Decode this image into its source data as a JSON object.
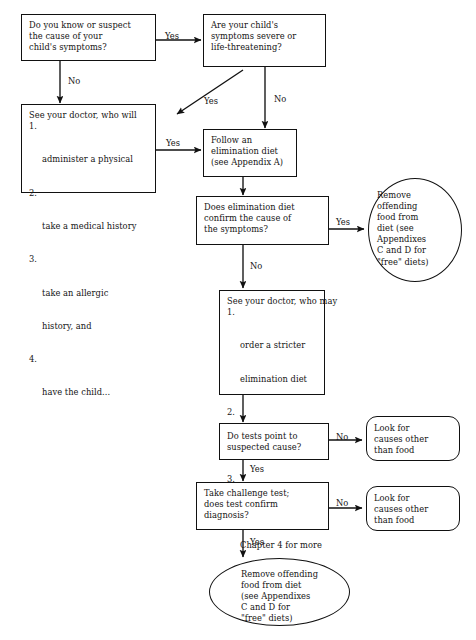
{
  "diagram": {
    "line_color": "#111111",
    "background": "#ffffff",
    "text_color": "#141414"
  },
  "nodes": {
    "q_know_cause": {
      "shape": "rectangle",
      "lines": [
        "Do you know or suspect",
        "the cause of your",
        "child's symptoms?"
      ]
    },
    "q_severe": {
      "shape": "rectangle",
      "lines": [
        "Are your child's",
        "symptoms severe or",
        "life-threatening?"
      ]
    },
    "doctor_will": {
      "shape": "rectangle",
      "heading": "See your doctor, who will",
      "items": [
        {
          "num": "1.",
          "lines": [
            "administer a physical"
          ]
        },
        {
          "num": "2.",
          "lines": [
            "take a medical history"
          ]
        },
        {
          "num": "3.",
          "lines": [
            "take an allergic",
            "history, and"
          ]
        },
        {
          "num": "4.",
          "lines": [
            "have the child..."
          ]
        }
      ]
    },
    "follow_diet": {
      "shape": "rectangle",
      "lines": [
        "Follow an",
        "elimination diet",
        "(see Appendix A)"
      ]
    },
    "q_diet_confirm": {
      "shape": "rectangle",
      "lines": [
        "Does elimination diet",
        "confirm the cause of",
        "the symptoms?"
      ]
    },
    "remove_food_top": {
      "shape": "oval",
      "lines": [
        "Remove",
        "offending",
        "food from",
        "diet (see",
        "Appendixes",
        "C and D for",
        "\"free\" diets)"
      ]
    },
    "doctor_may": {
      "shape": "rectangle",
      "heading": "See your doctor, who may",
      "items": [
        {
          "num": "1.",
          "lines": [
            "order a stricter",
            "elimination diet"
          ]
        },
        {
          "num": "2.",
          "lines": [
            "conduct skin tests"
          ]
        },
        {
          "num": "3.",
          "lines": [
            "order lab tests (see",
            "Chapter 4 for more",
            "on these tests)"
          ]
        }
      ]
    },
    "q_tests_point": {
      "shape": "rectangle",
      "lines": [
        "Do tests point to",
        "suspected cause?"
      ]
    },
    "look_other_1": {
      "shape": "rounded-rectangle",
      "lines": [
        "Look for",
        "causes other",
        "than food"
      ]
    },
    "q_challenge_test": {
      "shape": "rectangle",
      "lines": [
        "Take challenge test;",
        "does test confirm",
        "diagnosis?"
      ]
    },
    "look_other_2": {
      "shape": "rounded-rectangle",
      "lines": [
        "Look for",
        "causes other",
        "than food"
      ]
    },
    "remove_food_bottom": {
      "shape": "oval",
      "lines": [
        "Remove offending",
        "food from diet",
        "(see Appendixes",
        "C and D for",
        "\"free\" diets)"
      ]
    }
  },
  "edge_labels": {
    "know_cause_yes": "Yes",
    "know_cause_no": "No",
    "severe_yes": "Yes",
    "severe_no": "No",
    "doctor_will_yes": "Yes",
    "diet_confirm_yes": "Yes",
    "diet_confirm_no": "No",
    "tests_point_no": "No",
    "tests_point_yes": "Yes",
    "challenge_no": "No",
    "challenge_yes": "Yes"
  }
}
